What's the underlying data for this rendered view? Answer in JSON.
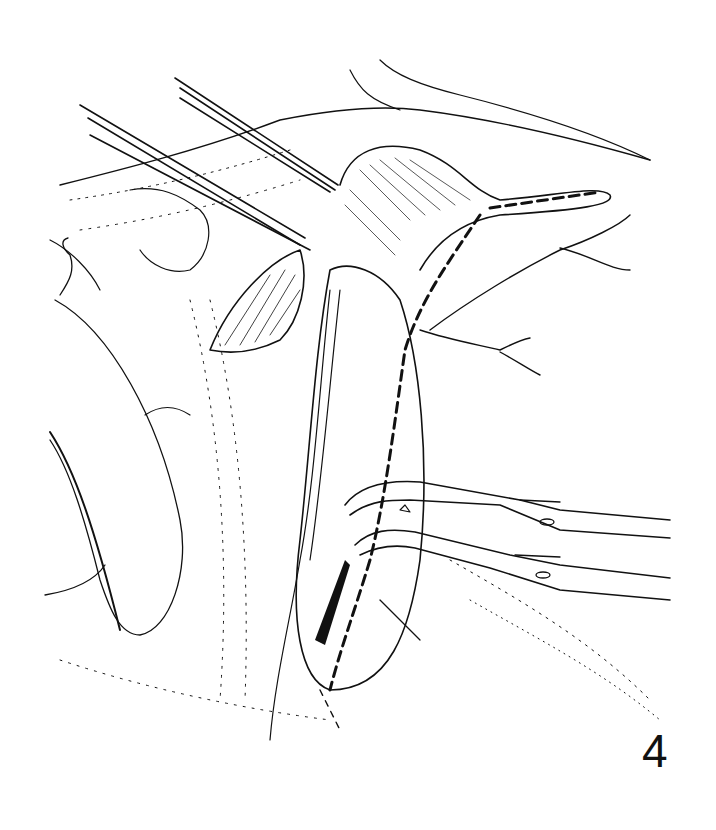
{
  "figure": {
    "number": "4",
    "style": "black-and-white surgical line illustration",
    "colors": {
      "ink": "#111111",
      "background": "#ffffff"
    },
    "depicted_elements": [
      "retractor-blade-left",
      "forceps-upper-left-pair",
      "incised-tissue-flap",
      "striated-muscle-region",
      "dashed-incision-line",
      "vessels-with-branches",
      "clamp-forceps-lower-right-pair",
      "stippled-skin-surface"
    ]
  }
}
